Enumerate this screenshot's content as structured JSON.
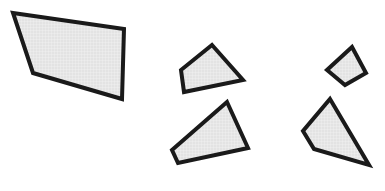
{
  "canvas": {
    "width": 385,
    "height": 191,
    "background_color": "#ffffff",
    "title": "Five shaded quadrilaterals on white background"
  },
  "style": {
    "fill_color": "#e3e3e3",
    "stroke_color": "#1a1a1a",
    "texture_color": "#f4f4f4",
    "texture_spacing": 3
  },
  "shapes": [
    {
      "name": "large-quadrilateral",
      "label": "Large left quadrilateral",
      "stroke_width": 4,
      "points": "13,13 124,29 122,99 33,73"
    },
    {
      "name": "small-quadrilateral-upper-middle",
      "label": "Small upper middle quadrilateral",
      "stroke_width": 4,
      "points": "212,45 243,80 184,92 181,70"
    },
    {
      "name": "medium-quadrilateral-lower-middle",
      "label": "Medium lower middle quadrilateral",
      "stroke_width": 4,
      "points": "227,102 248,148 178,163 172,150"
    },
    {
      "name": "small-quadrilateral-upper-right",
      "label": "Small upper right quadrilateral",
      "stroke_width": 4,
      "points": "352,47 366,73 345,85 327,70"
    },
    {
      "name": "medium-quadrilateral-lower-right",
      "label": "Medium lower right quadrilateral",
      "stroke_width": 4,
      "points": "330,99 369,165 314,149 303,131"
    }
  ]
}
